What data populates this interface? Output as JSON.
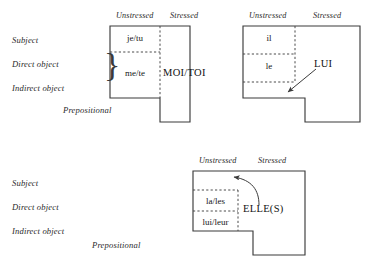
{
  "figure": {
    "caption": "",
    "columns": {
      "unstressed": "Unstressed",
      "stressed": "Stressed"
    },
    "row_labels": {
      "subject": "Subject",
      "direct_object": "Direct object",
      "indirect_object": "Indirect object",
      "prepositional": "Prepositional"
    },
    "diagrams": [
      {
        "id": "je-tu-moi-toi",
        "unstressed_cells": [
          "je/tu",
          "me/te"
        ],
        "stressed_label": "MOI/TOI",
        "brace": "}",
        "has_arrow": false
      },
      {
        "id": "il-le-lui",
        "unstressed_cells": [
          "il",
          "le"
        ],
        "stressed_label": "LUI",
        "brace": "",
        "has_arrow": true,
        "arrow_style": "straight"
      },
      {
        "id": "la-les-lui-leur-elles",
        "unstressed_cells": [
          "la/les",
          "lui/leur"
        ],
        "stressed_label": "ELLE(S)",
        "brace": "",
        "has_arrow": true,
        "arrow_style": "curved"
      }
    ]
  },
  "colors": {
    "stroke": "#3b3b3b",
    "dashed": "#4a4a4a",
    "text": "#161616",
    "background": "#ffffff"
  }
}
